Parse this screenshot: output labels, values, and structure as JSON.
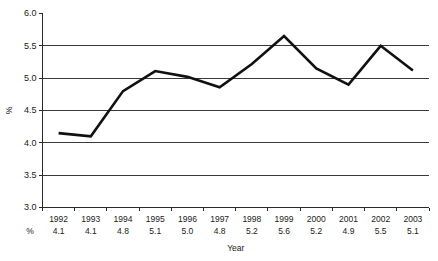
{
  "chart_data": {
    "type": "line",
    "title": "",
    "subtitle": "",
    "xlabel": "Year",
    "ylabel": "%",
    "categories": [
      "1992",
      "1993",
      "1994",
      "1995",
      "1996",
      "1997",
      "1998",
      "1999",
      "2000",
      "2001",
      "2002",
      "2003"
    ],
    "values": [
      4.15,
      4.1,
      4.8,
      5.11,
      5.02,
      4.86,
      5.22,
      5.65,
      5.15,
      4.9,
      5.5,
      5.12
    ],
    "data_table": {
      "row_header": "%",
      "values": [
        "4.1",
        "4.1",
        "4.8",
        "5.1",
        "5.0",
        "4.8",
        "5.2",
        "5.6",
        "5.2",
        "4.9",
        "5.5",
        "5.1"
      ]
    },
    "ylim": [
      3.0,
      6.0
    ],
    "yticks": [
      "3.0",
      "3.5",
      "4.0",
      "4.5",
      "5.0",
      "5.5",
      "6.0"
    ],
    "ytick_values": [
      3.0,
      3.5,
      4.0,
      4.5,
      5.0,
      5.5,
      6.0
    ],
    "grid": "horizontal",
    "gridlines_at": [
      3.5,
      4.0,
      4.5,
      5.0,
      5.5
    ],
    "legend": "none",
    "series_color": "#111111",
    "grid_color": "#3a3a3a",
    "axis_color": "#2a2a2a",
    "background": "#ffffff"
  }
}
